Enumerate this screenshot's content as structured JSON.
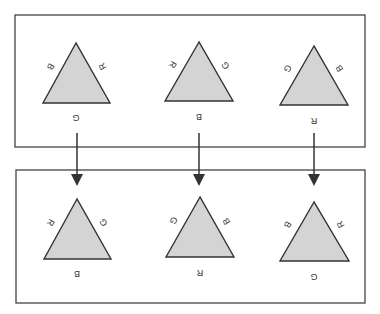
{
  "diagram": {
    "top_row": [
      {
        "left": "B",
        "right": "R",
        "bottom": "G"
      },
      {
        "left": "R",
        "right": "G",
        "bottom": "B"
      },
      {
        "left": "G",
        "right": "B",
        "bottom": "R"
      }
    ],
    "bottom_row": [
      {
        "left": "R",
        "right": "G",
        "bottom": "B"
      },
      {
        "left": "G",
        "right": "B",
        "bottom": "R"
      },
      {
        "left": "B",
        "right": "R",
        "bottom": "G"
      }
    ],
    "colors": {
      "fill": "#d4d4d4",
      "stroke": "#333333",
      "box": "#444444"
    }
  }
}
